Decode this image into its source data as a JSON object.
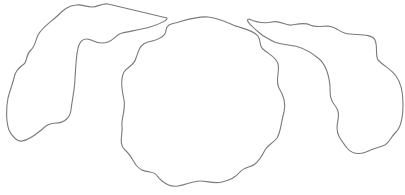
{
  "canvas": {
    "width": 405,
    "height": 195,
    "background": "#ffffff"
  },
  "style": {
    "stroke": "#7a7a7a"
  },
  "shapes": [
    {
      "name": "left-blob"
    },
    {
      "name": "center-blob"
    },
    {
      "name": "right-blob"
    }
  ]
}
